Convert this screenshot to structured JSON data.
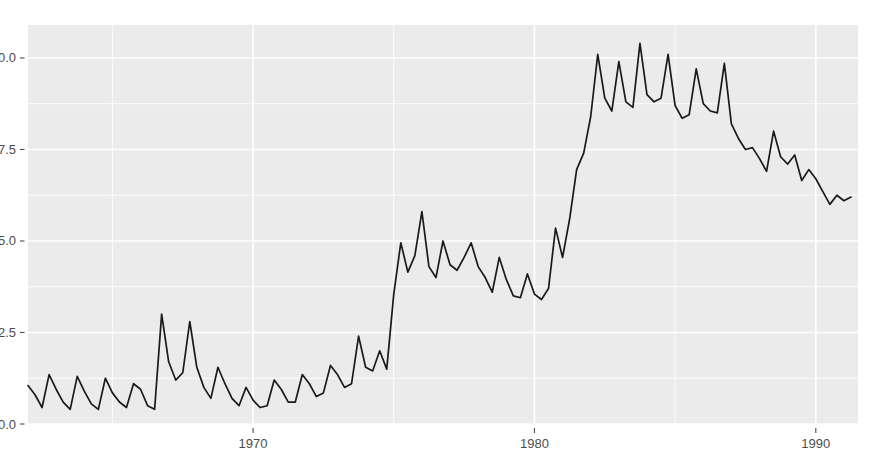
{
  "chart_data": {
    "type": "line",
    "title": "",
    "subtitle": "",
    "xlabel": "",
    "ylabel": "",
    "xlim": [
      1962.0,
      1991.5
    ],
    "ylim": [
      0.0,
      10.9
    ],
    "grid": true,
    "legend": "none",
    "x_tick_labels": [
      "1970",
      "1980",
      "1990"
    ],
    "x_ticks": [
      1970,
      1980,
      1990
    ],
    "x_minor_ticks": [
      1965,
      1975,
      1985
    ],
    "y_tick_labels": [
      "0.0",
      "2.5",
      "5.0",
      "7.5",
      "10.0"
    ],
    "y_ticks": [
      0.0,
      2.5,
      5.0,
      7.5,
      10.0
    ],
    "y_minor_ticks": [
      1.25,
      3.75,
      6.25,
      8.75
    ],
    "series": [
      {
        "name": "value",
        "x": [
          1962.0,
          1962.25,
          1962.5,
          1962.75,
          1963.0,
          1963.25,
          1963.5,
          1963.75,
          1964.0,
          1964.25,
          1964.5,
          1964.75,
          1965.0,
          1965.25,
          1965.5,
          1965.75,
          1966.0,
          1966.25,
          1966.5,
          1966.75,
          1967.0,
          1967.25,
          1967.5,
          1967.75,
          1968.0,
          1968.25,
          1968.5,
          1968.75,
          1969.0,
          1969.25,
          1969.5,
          1969.75,
          1970.0,
          1970.25,
          1970.5,
          1970.75,
          1971.0,
          1971.25,
          1971.5,
          1971.75,
          1972.0,
          1972.25,
          1972.5,
          1972.75,
          1973.0,
          1973.25,
          1973.5,
          1973.75,
          1974.0,
          1974.25,
          1974.5,
          1974.75,
          1975.0,
          1975.25,
          1975.5,
          1975.75,
          1976.0,
          1976.25,
          1976.5,
          1976.75,
          1977.0,
          1977.25,
          1977.5,
          1977.75,
          1978.0,
          1978.25,
          1978.5,
          1978.75,
          1979.0,
          1979.25,
          1979.5,
          1979.75,
          1980.0,
          1980.25,
          1980.5,
          1980.75,
          1981.0,
          1981.25,
          1981.5,
          1981.75,
          1982.0,
          1982.25,
          1982.5,
          1982.75,
          1983.0,
          1983.25,
          1983.5,
          1983.75,
          1984.0,
          1984.25,
          1984.5,
          1984.75,
          1985.0,
          1985.25,
          1985.5,
          1985.75,
          1986.0,
          1986.25,
          1986.5,
          1986.75,
          1987.0,
          1987.25,
          1987.5,
          1987.75,
          1988.0,
          1988.25,
          1988.5,
          1988.75,
          1989.0,
          1989.25,
          1989.5,
          1989.75,
          1990.0,
          1990.25,
          1990.5,
          1990.75,
          1991.0,
          1991.25
        ],
        "values": [
          1.05,
          0.8,
          0.45,
          1.35,
          0.95,
          0.6,
          0.4,
          1.3,
          0.9,
          0.55,
          0.4,
          1.25,
          0.85,
          0.6,
          0.45,
          1.1,
          0.95,
          0.5,
          0.4,
          3.0,
          1.7,
          1.2,
          1.4,
          2.8,
          1.55,
          1.0,
          0.7,
          1.55,
          1.1,
          0.7,
          0.5,
          1.0,
          0.65,
          0.45,
          0.5,
          1.2,
          0.95,
          0.6,
          0.6,
          1.35,
          1.1,
          0.75,
          0.85,
          1.6,
          1.35,
          1.0,
          1.1,
          2.4,
          1.55,
          1.45,
          2.0,
          1.5,
          3.55,
          4.95,
          4.15,
          4.6,
          5.8,
          4.3,
          4.0,
          5.0,
          4.35,
          4.2,
          4.55,
          4.95,
          4.3,
          4.0,
          3.6,
          4.55,
          3.95,
          3.5,
          3.45,
          4.1,
          3.55,
          3.4,
          3.7,
          5.35,
          4.55,
          5.6,
          6.95,
          7.4,
          8.4,
          10.1,
          8.9,
          8.55,
          9.9,
          8.8,
          8.65,
          10.4,
          9.0,
          8.8,
          8.9,
          10.1,
          8.7,
          8.35,
          8.45,
          9.7,
          8.75,
          8.55,
          8.5,
          9.85,
          8.2,
          7.8,
          7.5,
          7.55,
          7.25,
          6.9,
          8.0,
          7.3,
          7.1,
          7.35,
          6.65,
          6.95,
          6.7,
          6.35,
          6.0,
          6.25,
          6.1,
          6.2
        ]
      }
    ]
  },
  "axes": {
    "y_axis_name": "y-axis",
    "x_axis_name": "x-axis"
  }
}
